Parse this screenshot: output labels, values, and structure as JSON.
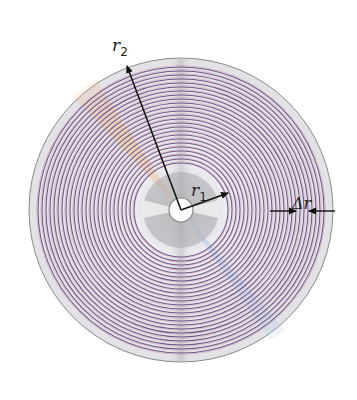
{
  "diagram": {
    "labels": {
      "outer_radius": {
        "main": "r",
        "sub": "2"
      },
      "inner_radius": {
        "main": "r",
        "sub": "1"
      },
      "track_spacing": "Δr"
    },
    "track_count": 25,
    "colors": {
      "track_primary": "#6f5a8c",
      "track_secondary": "#c98a9a",
      "disc_base": "#e4e4e8",
      "disc_edge": "#8a8a8a",
      "arrow": "#111111",
      "rainbow_warm": "#f0b080",
      "rainbow_cool": "#9cc0e0"
    }
  }
}
